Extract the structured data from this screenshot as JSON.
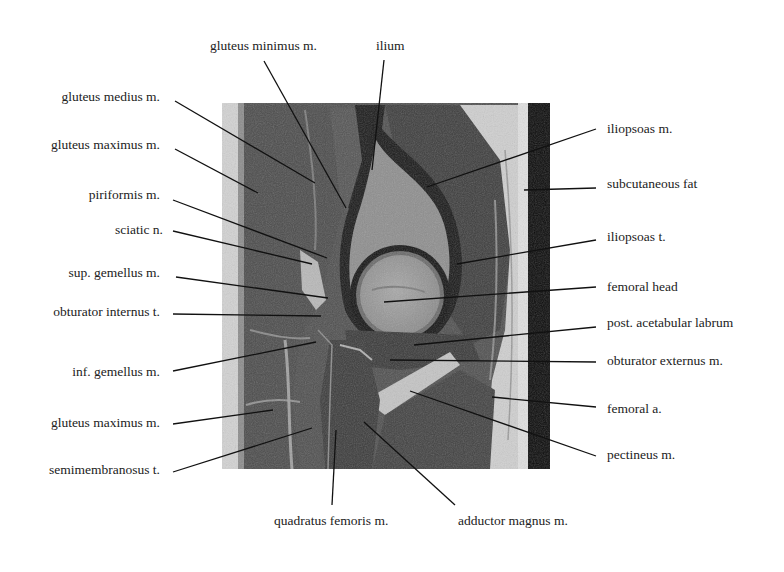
{
  "figure": {
    "type": "annotated sagittal MRI of hip joint",
    "image_region": {
      "x": 222,
      "y": 103,
      "width": 328,
      "height": 366
    }
  },
  "labels": {
    "top": [
      {
        "id": "gluteus-minimus",
        "text": "gluteus minimus m."
      },
      {
        "id": "ilium",
        "text": "ilium"
      }
    ],
    "left": [
      {
        "id": "gluteus-medius",
        "text": "gluteus medius m."
      },
      {
        "id": "gluteus-maximus-upper",
        "text": "gluteus maximus m."
      },
      {
        "id": "piriformis",
        "text": "piriformis m."
      },
      {
        "id": "sciatic-nerve",
        "text": "sciatic n."
      },
      {
        "id": "sup-gemellus",
        "text": "sup. gemellus m."
      },
      {
        "id": "obturator-internus",
        "text": "obturator internus t."
      },
      {
        "id": "inf-gemellus",
        "text": "inf. gemellus m."
      },
      {
        "id": "gluteus-maximus-lower",
        "text": "gluteus maximus m."
      },
      {
        "id": "semimembranosus",
        "text": "semimembranosus t."
      }
    ],
    "right": [
      {
        "id": "iliopsoas-m",
        "text": "iliopsoas m."
      },
      {
        "id": "subcutaneous-fat",
        "text": "subcutaneous fat"
      },
      {
        "id": "iliopsoas-t",
        "text": "iliopsoas t."
      },
      {
        "id": "femoral-head",
        "text": "femoral head"
      },
      {
        "id": "post-acetabular-labrum",
        "text": "post. acetabular labrum"
      },
      {
        "id": "obturator-externus",
        "text": "obturator externus m."
      },
      {
        "id": "femoral-artery",
        "text": "femoral a."
      },
      {
        "id": "pectineus",
        "text": "pectineus m."
      }
    ],
    "bottom": [
      {
        "id": "quadratus-femoris",
        "text": "quadratus femoris m."
      },
      {
        "id": "adductor-magnus",
        "text": "adductor magnus m."
      }
    ]
  },
  "colors": {
    "background": "#ffffff",
    "text": "#222222",
    "leader_line": "#111111",
    "muscle_dark": "#4a4a4a",
    "fat_bright": "#d8d8d8",
    "bone_marrow": "#9a9a9a",
    "cortex_black": "#111111"
  }
}
